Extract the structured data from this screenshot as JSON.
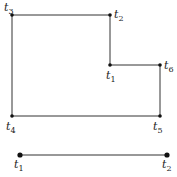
{
  "diagram": {
    "polygon": {
      "stroke": "#333333",
      "vertices": [
        {
          "id": "t3",
          "label": "t",
          "sub": "3",
          "x": 12,
          "y": 15,
          "lx": 4,
          "ly": 11
        },
        {
          "id": "t2",
          "label": "t",
          "sub": "2",
          "x": 110,
          "y": 15,
          "lx": 114,
          "ly": 18
        },
        {
          "id": "t1",
          "label": "t",
          "sub": "1",
          "x": 110,
          "y": 65,
          "lx": 106,
          "ly": 79
        },
        {
          "id": "t6",
          "label": "t",
          "sub": "6",
          "x": 160,
          "y": 65,
          "lx": 164,
          "ly": 69
        },
        {
          "id": "t5",
          "label": "t",
          "sub": "5",
          "x": 160,
          "y": 116,
          "lx": 153,
          "ly": 130
        },
        {
          "id": "t4",
          "label": "t",
          "sub": "4",
          "x": 12,
          "y": 116,
          "lx": 6,
          "ly": 130
        }
      ]
    },
    "segment": {
      "stroke": "#333333",
      "endpoints": [
        {
          "id": "t1",
          "label": "t",
          "sub": "1",
          "x": 20,
          "y": 155,
          "lx": 14,
          "ly": 168
        },
        {
          "id": "t2",
          "label": "t",
          "sub": "2",
          "x": 167,
          "y": 155,
          "lx": 162,
          "ly": 168
        }
      ]
    }
  }
}
